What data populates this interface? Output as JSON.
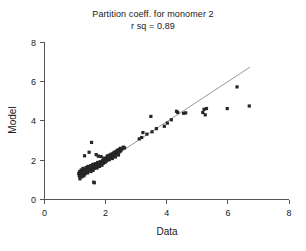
{
  "chart_data": {
    "type": "scatter",
    "title": "Partition coeff. for monomer 2",
    "subtitle": "r sq = 0.89",
    "xlabel": "Data",
    "ylabel": "Model",
    "xlim": [
      0,
      8
    ],
    "ylim": [
      0,
      8
    ],
    "xticks": [
      0,
      2,
      4,
      6,
      8
    ],
    "yticks": [
      0,
      2,
      4,
      6,
      8
    ],
    "grid": false,
    "legend": null,
    "marker_style": "filled-square",
    "marker_color": "#262626",
    "fit_line": {
      "label": "identity/regression line",
      "color": "#9a9a9a",
      "x_start": 1.15,
      "y_start": 1.05,
      "x_end": 6.72,
      "y_end": 6.72
    },
    "annotations": [
      {
        "text": "r sq = 0.89",
        "x": 4.0,
        "y": 7.6
      }
    ],
    "points": [
      [
        1.12,
        1.32
      ],
      [
        1.14,
        1.18
      ],
      [
        1.15,
        1.42
      ],
      [
        1.16,
        1.05
      ],
      [
        1.18,
        1.25
      ],
      [
        1.2,
        1.5
      ],
      [
        1.21,
        1.35
      ],
      [
        1.22,
        1.15
      ],
      [
        1.24,
        1.45
      ],
      [
        1.25,
        1.28
      ],
      [
        1.26,
        1.58
      ],
      [
        1.28,
        1.38
      ],
      [
        1.29,
        1.2
      ],
      [
        1.3,
        1.48
      ],
      [
        1.31,
        2.22
      ],
      [
        1.32,
        1.3
      ],
      [
        1.34,
        1.52
      ],
      [
        1.35,
        1.4
      ],
      [
        1.36,
        1.62
      ],
      [
        1.38,
        1.44
      ],
      [
        1.4,
        1.55
      ],
      [
        1.41,
        1.35
      ],
      [
        1.42,
        1.68
      ],
      [
        1.44,
        1.48
      ],
      [
        1.45,
        1.58
      ],
      [
        1.46,
        2.4
      ],
      [
        1.48,
        1.5
      ],
      [
        1.5,
        1.62
      ],
      [
        1.51,
        1.72
      ],
      [
        1.52,
        1.42
      ],
      [
        1.54,
        2.9
      ],
      [
        1.55,
        1.55
      ],
      [
        1.56,
        1.65
      ],
      [
        1.58,
        1.78
      ],
      [
        1.59,
        1.48
      ],
      [
        1.6,
        1.6
      ],
      [
        1.61,
        0.88
      ],
      [
        1.62,
        1.7
      ],
      [
        1.63,
        0.85
      ],
      [
        1.64,
        1.58
      ],
      [
        1.66,
        1.82
      ],
      [
        1.68,
        1.66
      ],
      [
        1.69,
        2.28
      ],
      [
        1.7,
        1.75
      ],
      [
        1.72,
        1.6
      ],
      [
        1.74,
        1.88
      ],
      [
        1.75,
        1.72
      ],
      [
        1.76,
        2.2
      ],
      [
        1.78,
        1.8
      ],
      [
        1.8,
        1.68
      ],
      [
        1.82,
        1.92
      ],
      [
        1.84,
        1.78
      ],
      [
        1.85,
        2.18
      ],
      [
        1.86,
        1.86
      ],
      [
        1.88,
        1.74
      ],
      [
        1.9,
        1.98
      ],
      [
        1.92,
        1.84
      ],
      [
        1.94,
        2.1
      ],
      [
        1.95,
        1.9
      ],
      [
        1.96,
        2.02
      ],
      [
        1.98,
        1.88
      ],
      [
        2.0,
        2.06
      ],
      [
        2.02,
        1.95
      ],
      [
        2.04,
        2.14
      ],
      [
        2.05,
        2.0
      ],
      [
        2.06,
        2.22
      ],
      [
        2.08,
        2.08
      ],
      [
        2.1,
        2.18
      ],
      [
        2.12,
        2.02
      ],
      [
        2.14,
        2.26
      ],
      [
        2.16,
        2.12
      ],
      [
        2.18,
        2.3
      ],
      [
        2.2,
        2.2
      ],
      [
        2.22,
        2.08
      ],
      [
        2.24,
        2.34
      ],
      [
        2.26,
        2.22
      ],
      [
        2.28,
        2.4
      ],
      [
        2.3,
        2.28
      ],
      [
        2.32,
        2.16
      ],
      [
        2.34,
        2.44
      ],
      [
        2.36,
        2.32
      ],
      [
        2.38,
        2.5
      ],
      [
        2.4,
        2.38
      ],
      [
        2.42,
        2.26
      ],
      [
        2.44,
        2.54
      ],
      [
        2.46,
        2.42
      ],
      [
        2.48,
        2.6
      ],
      [
        2.5,
        2.48
      ],
      [
        2.54,
        2.58
      ],
      [
        2.58,
        2.66
      ],
      [
        2.62,
        2.62
      ],
      [
        3.1,
        3.08
      ],
      [
        3.18,
        3.15
      ],
      [
        3.22,
        3.4
      ],
      [
        3.35,
        3.32
      ],
      [
        3.48,
        4.22
      ],
      [
        3.52,
        3.44
      ],
      [
        3.66,
        3.6
      ],
      [
        3.92,
        3.72
      ],
      [
        4.02,
        3.88
      ],
      [
        4.15,
        4.05
      ],
      [
        4.32,
        4.48
      ],
      [
        4.36,
        4.42
      ],
      [
        4.55,
        4.38
      ],
      [
        4.62,
        4.4
      ],
      [
        5.18,
        4.42
      ],
      [
        5.22,
        4.58
      ],
      [
        5.26,
        4.3
      ],
      [
        5.3,
        4.62
      ],
      [
        5.98,
        4.62
      ],
      [
        6.3,
        5.72
      ],
      [
        6.7,
        4.75
      ]
    ]
  }
}
